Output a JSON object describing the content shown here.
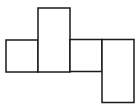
{
  "diagram": {
    "type": "cube-net-style",
    "stroke_color": "#1a1a1a",
    "fill_color": "#ffffff",
    "stroke_width": 1.5,
    "faces": [
      {
        "id": "face-left",
        "x": 6,
        "y": 40,
        "w": 32,
        "h": 32
      },
      {
        "id": "face-tall",
        "x": 38,
        "y": 8,
        "w": 32,
        "h": 64
      },
      {
        "id": "face-middle",
        "x": 70,
        "y": 39.5,
        "w": 32,
        "h": 32
      },
      {
        "id": "face-right-tall",
        "x": 102,
        "y": 39.5,
        "w": 32,
        "h": 63
      }
    ]
  }
}
